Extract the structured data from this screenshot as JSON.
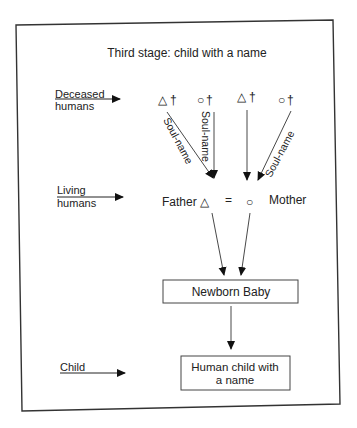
{
  "title": "Third stage: child with a name",
  "row_labels": {
    "deceased": [
      "Deceased",
      "humans"
    ],
    "living": [
      "Living",
      "humans"
    ],
    "child": [
      "Child"
    ]
  },
  "ancestors": [
    {
      "symbol": "△",
      "mark": "†",
      "kind": "male"
    },
    {
      "symbol": "○",
      "mark": "†",
      "kind": "female"
    },
    {
      "symbol": "△",
      "mark": "†",
      "kind": "male"
    },
    {
      "symbol": "○",
      "mark": "†",
      "kind": "female"
    }
  ],
  "arrow_labels": {
    "a1": "Soul-name",
    "a2": "Soul-name",
    "a4": "Soul-name"
  },
  "parents": {
    "father": "Father",
    "father_symbol": "△",
    "equals": "=",
    "mother_symbol": "○",
    "mother": "Mother"
  },
  "boxes": {
    "newborn": "Newborn Baby",
    "named_child": [
      "Human child with",
      "a name"
    ]
  },
  "colors": {
    "ink": "#222222",
    "frame": "#333333",
    "background": "#ffffff"
  }
}
